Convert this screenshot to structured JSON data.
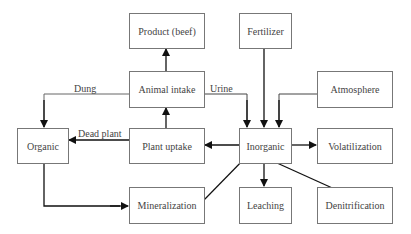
{
  "diagram": {
    "type": "flowchart",
    "title": "",
    "nodes": [
      {
        "id": "product",
        "label": "Product (beef)"
      },
      {
        "id": "fertilizer",
        "label": "Fertilizer"
      },
      {
        "id": "animal_intake",
        "label": "Animal intake"
      },
      {
        "id": "atmosphere",
        "label": "Atmosphere"
      },
      {
        "id": "organic",
        "label": "Organic"
      },
      {
        "id": "plant_uptake",
        "label": "Plant uptake"
      },
      {
        "id": "inorganic",
        "label": "Inorganic"
      },
      {
        "id": "volatilization",
        "label": "Volatilization"
      },
      {
        "id": "mineralization",
        "label": "Mineralization"
      },
      {
        "id": "leaching",
        "label": "Leaching"
      },
      {
        "id": "denitrification",
        "label": "Denitrification"
      }
    ],
    "edges": [
      {
        "from": "animal_intake",
        "to": "product",
        "label": ""
      },
      {
        "from": "plant_uptake",
        "to": "animal_intake",
        "label": ""
      },
      {
        "from": "animal_intake",
        "to": "organic",
        "label": "Dung"
      },
      {
        "from": "animal_intake",
        "to": "inorganic",
        "label": "Urine"
      },
      {
        "from": "fertilizer",
        "to": "inorganic",
        "label": ""
      },
      {
        "from": "atmosphere",
        "to": "inorganic",
        "label": ""
      },
      {
        "from": "plant_uptake",
        "to": "organic",
        "label": "Dead plant"
      },
      {
        "from": "inorganic",
        "to": "plant_uptake",
        "label": ""
      },
      {
        "from": "inorganic",
        "to": "volatilization",
        "label": ""
      },
      {
        "from": "organic",
        "to": "mineralization",
        "label": ""
      },
      {
        "from": "mineralization",
        "to": "inorganic",
        "label": ""
      },
      {
        "from": "inorganic",
        "to": "leaching",
        "label": ""
      },
      {
        "from": "inorganic",
        "to": "denitrification",
        "label": ""
      }
    ],
    "edge_labels": {
      "dung": "Dung",
      "urine": "Urine",
      "dead_plant": "Dead plant"
    }
  }
}
